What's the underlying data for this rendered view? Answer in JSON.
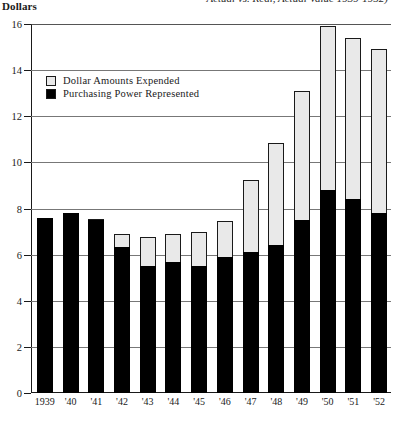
{
  "title": {
    "clipped_text": "Actual vs. Real, Actual Value 1939-1952)"
  },
  "axis": {
    "y_label": "Dollars",
    "y_ticks": [
      16,
      14,
      12,
      10,
      8,
      6,
      4,
      2,
      0
    ],
    "y_min": 0,
    "y_max": 16
  },
  "legend": {
    "items": [
      {
        "label": "Dollar Amounts Expended",
        "swatch": "dotted"
      },
      {
        "label": "Purchasing Power Represented",
        "swatch": "solid"
      }
    ]
  },
  "chart_data": {
    "type": "bar",
    "xlabel": "",
    "ylabel": "Dollars",
    "ylim": [
      0,
      16
    ],
    "grid": true,
    "legend_position": "upper-left-inside",
    "categories": [
      "1939",
      "'40",
      "'41",
      "'42",
      "'43",
      "'44",
      "'45",
      "'46",
      "'47",
      "'48",
      "'49",
      "'50",
      "'51",
      "'52"
    ],
    "series": [
      {
        "name": "Dollar Amounts Expended",
        "style": "dotted",
        "values": [
          7.6,
          7.8,
          7.55,
          6.9,
          6.75,
          6.9,
          7.0,
          7.45,
          9.25,
          10.85,
          13.1,
          15.9,
          15.4,
          14.9
        ]
      },
      {
        "name": "Purchasing Power Represented",
        "style": "solid-black",
        "values": [
          7.6,
          7.8,
          7.5,
          6.35,
          5.5,
          5.7,
          5.5,
          5.9,
          6.1,
          6.4,
          7.5,
          8.8,
          8.4,
          7.8
        ]
      }
    ]
  }
}
